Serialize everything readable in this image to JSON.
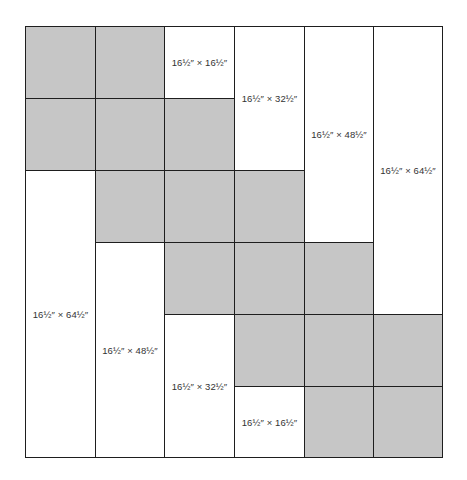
{
  "diagram": {
    "type": "quilt-layout",
    "grid": {
      "columns": 6,
      "rows": 6
    },
    "colors": {
      "gray_fill": "#c6c6c6",
      "white_fill": "#ffffff",
      "line": "#1e1e1e",
      "text": "#333333"
    },
    "gray_squares": [
      {
        "col": 0,
        "row": 0
      },
      {
        "col": 1,
        "row": 0
      },
      {
        "col": 0,
        "row": 1
      },
      {
        "col": 1,
        "row": 1
      },
      {
        "col": 2,
        "row": 1
      },
      {
        "col": 1,
        "row": 2
      },
      {
        "col": 2,
        "row": 2
      },
      {
        "col": 3,
        "row": 2
      },
      {
        "col": 2,
        "row": 3
      },
      {
        "col": 3,
        "row": 3
      },
      {
        "col": 4,
        "row": 3
      },
      {
        "col": 3,
        "row": 4
      },
      {
        "col": 4,
        "row": 4
      },
      {
        "col": 5,
        "row": 4
      },
      {
        "col": 4,
        "row": 5
      },
      {
        "col": 5,
        "row": 5
      }
    ],
    "white_pieces": [
      {
        "col": 2,
        "row": 0,
        "span": 1,
        "label": "16½″ × 16½″"
      },
      {
        "col": 3,
        "row": 0,
        "span": 2,
        "label": "16½″ × 32½″"
      },
      {
        "col": 4,
        "row": 0,
        "span": 3,
        "label": "16½″ × 48½″"
      },
      {
        "col": 5,
        "row": 0,
        "span": 4,
        "label": "16½″ × 64½″"
      },
      {
        "col": 0,
        "row": 2,
        "span": 4,
        "label": "16½″ × 64½″"
      },
      {
        "col": 1,
        "row": 3,
        "span": 3,
        "label": "16½″ × 48½″"
      },
      {
        "col": 2,
        "row": 4,
        "span": 2,
        "label": "16½″ × 32½″"
      },
      {
        "col": 3,
        "row": 5,
        "span": 1,
        "label": "16½″ × 16½″"
      }
    ]
  }
}
